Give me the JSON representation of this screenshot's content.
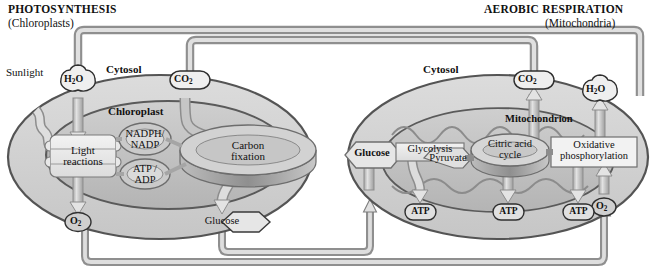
{
  "diagram": {
    "type": "process-cycle-diagram",
    "background": "#ffffff",
    "colors": {
      "cell_fill": "#d2d2d2",
      "organelle_fill": "#c0c0c0",
      "membrane_stroke": "#4a4a4a",
      "pipe_fill": "#c9c9c9",
      "pipe_stroke": "#8a8a8a",
      "box_fill": "#e8e8e8",
      "text": "#111111"
    }
  },
  "headings": {
    "left": {
      "title": "PHOTOSYNTHESIS",
      "subtitle": "(Chloroplasts)"
    },
    "right": {
      "title": "AEROBIC RESPIRATION",
      "subtitle": "(Mitochondria)"
    }
  },
  "left_cell": {
    "cytosol_label": "Cytosol",
    "organelle_label": "Chloroplast",
    "external_input": "Sunlight",
    "inputs": [
      {
        "name": "molecule-h2o",
        "label_html": "H<sub>2</sub>O",
        "label": "H2O"
      },
      {
        "name": "molecule-co2",
        "label_html": "CO<sub>2</sub>",
        "label": "CO2"
      }
    ],
    "outputs": [
      {
        "name": "molecule-o2",
        "label_html": "O<sub>2</sub>",
        "label": "O2"
      },
      {
        "name": "molecule-glucose",
        "label": "Glucose"
      }
    ],
    "processes": [
      {
        "name": "light-reactions",
        "label_line1": "Light",
        "label_line2": "reactions",
        "shape": "thylakoid-stack"
      },
      {
        "name": "carbon-fixation",
        "label_line1": "Carbon",
        "label_line2": "fixation",
        "shape": "ring"
      }
    ],
    "carriers": [
      {
        "name": "nadph-nadp-cycle",
        "label_line1": "NADPH/",
        "label_line2": "NADP",
        "shape": "ring"
      },
      {
        "name": "atp-adp-cycle",
        "label_line1": "ATP /",
        "label_line2": "ADP",
        "shape": "ring"
      }
    ]
  },
  "right_cell": {
    "cytosol_label": "Cytosol",
    "organelle_label": "Mitochondrion",
    "inputs": [
      {
        "name": "molecule-glucose-in",
        "label": "Glucose"
      },
      {
        "name": "molecule-o2-in",
        "label_html": "O<sub>2</sub>",
        "label": "O2"
      }
    ],
    "outputs": [
      {
        "name": "molecule-co2-out",
        "label_html": "CO<sub>2</sub>",
        "label": "CO2"
      },
      {
        "name": "molecule-h2o-out",
        "label_html": "H<sub>2</sub>O",
        "label": "H2O"
      }
    ],
    "intermediate": {
      "name": "molecule-pyruvate",
      "label": "Pyruvate"
    },
    "processes": [
      {
        "name": "glycolysis",
        "label": "Glycolysis",
        "shape": "box"
      },
      {
        "name": "citric-acid-cycle",
        "label_line1": "Citric acid",
        "label_line2": "cycle",
        "shape": "ring"
      },
      {
        "name": "oxidative-phosphorylation",
        "label_line1": "Oxidative",
        "label_line2": "phosphorylation",
        "shape": "box"
      }
    ],
    "energy_outputs": [
      {
        "name": "atp-glycolysis",
        "label": "ATP"
      },
      {
        "name": "atp-citric-acid-cycle",
        "label": "ATP"
      },
      {
        "name": "atp-oxidative-phosphorylation",
        "label": "ATP"
      }
    ]
  },
  "connections": [
    {
      "name": "pipe-h2o-right-to-left",
      "from": "right_cell.h2o",
      "to": "left_cell.h2o",
      "route": "top-outer"
    },
    {
      "name": "pipe-co2-right-to-left",
      "from": "right_cell.co2",
      "to": "left_cell.co2",
      "route": "top-inner"
    },
    {
      "name": "pipe-glucose-left-to-right",
      "from": "left_cell.glucose",
      "to": "right_cell.glucose",
      "route": "bottom-inner"
    },
    {
      "name": "pipe-o2-left-to-right",
      "from": "left_cell.o2",
      "to": "right_cell.o2",
      "route": "bottom-outer"
    }
  ]
}
